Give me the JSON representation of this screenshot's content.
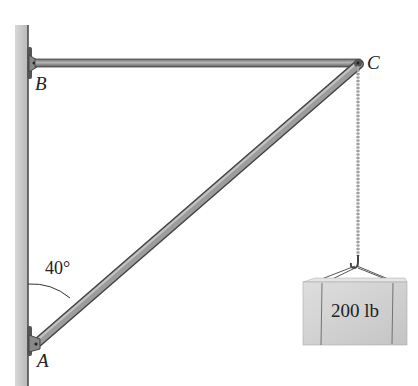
{
  "diagram": {
    "type": "statics-boom-crane",
    "points": {
      "A": "A",
      "B": "B",
      "C": "C"
    },
    "angle_label": "40°",
    "load_label": "200 lb",
    "colors": {
      "wall": "#c8c8c8",
      "member": "#8a8a8a",
      "box": "#cfcfcf",
      "text": "#222222"
    }
  }
}
